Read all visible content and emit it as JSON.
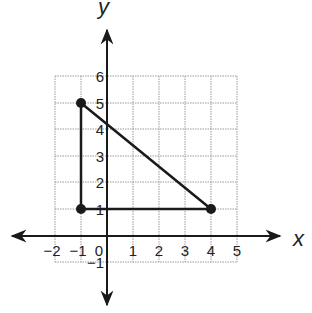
{
  "diagram": {
    "type": "coordinate-plane",
    "axes": {
      "x_label": "x",
      "y_label": "y",
      "x_ticks": [
        "−2",
        "−1",
        "0",
        "1",
        "2",
        "3",
        "4",
        "5"
      ],
      "y_ticks": [
        "6",
        "5",
        "4",
        "3",
        "2",
        "1",
        "−1"
      ]
    },
    "grid": {
      "x_range": [
        -2,
        5
      ],
      "y_range": [
        -1,
        6
      ]
    },
    "points": [
      {
        "label": "A",
        "x": -1,
        "y": 5
      },
      {
        "label": "B",
        "x": -1,
        "y": 1
      },
      {
        "label": "C",
        "x": 4,
        "y": 1
      }
    ],
    "shape": "right triangle",
    "colors": {
      "line": "#1a1a1a",
      "grid": "#9a9a9a",
      "background": "#ffffff"
    }
  }
}
